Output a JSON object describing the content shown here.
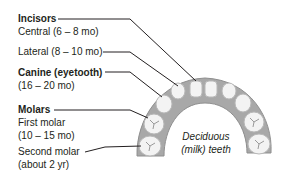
{
  "diagram": {
    "arch_label": [
      "Deciduous",
      "(milk) teeth"
    ],
    "groups": [
      {
        "heading": "Incisors",
        "items": [
          {
            "name": "Central",
            "age": "(6 – 8 mo)"
          },
          {
            "name": "Lateral",
            "age": "(8 – 10 mo)"
          }
        ]
      },
      {
        "heading": "Canine (eyetooth)",
        "items": [
          {
            "name": "",
            "age": "(16 – 20 mo)"
          }
        ]
      },
      {
        "heading": "Molars",
        "items": [
          {
            "name": "First molar",
            "age": "(10 – 15 mo)"
          },
          {
            "name": "Second molar",
            "age": "(about 2 yr)"
          }
        ]
      }
    ],
    "labels": {
      "incisors": "Incisors",
      "central": "Central (6 – 8 mo)",
      "lateral": "Lateral (8 – 10 mo)",
      "canine": "Canine (eyetooth)",
      "canine_age": "(16 – 20 mo)",
      "molars": "Molars",
      "first_molar": "First molar",
      "first_molar_age": "(10 – 15 mo)",
      "second_molar": "Second molar",
      "second_molar_age": "(about 2 yr)",
      "arch_line1": "Deciduous",
      "arch_line2": "(milk) teeth"
    },
    "colors": {
      "gum": "#a8a8a8",
      "gum_dark": "#8a8a8a",
      "tooth": "#f2f2f2",
      "tooth_edge": "#bdbdbd",
      "leader_line": "#231f20"
    }
  }
}
